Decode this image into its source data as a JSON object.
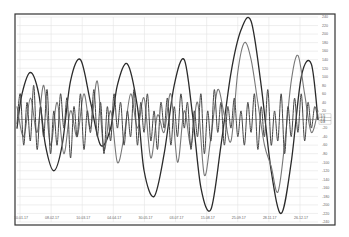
{
  "chart_data": {
    "type": "line",
    "title": "",
    "xlabel": "",
    "ylabel": "",
    "grid": true,
    "legend": "none",
    "x_tick_labels": [
      "10.01.17",
      "08.02.17",
      "10.03.17",
      "04.04.17",
      "30.05.17",
      "03.07.17",
      "15.08.17",
      "15.08.17",
      "25.09.17",
      "28.11.17",
      "26.12.17"
    ],
    "x_ticks_display": [
      "10.01.17",
      "08.02.17",
      "10.03.17",
      "04.04.17",
      "30.05.17",
      "03.07.17",
      "15.08.17",
      "25.09.17",
      "28.11.17",
      "26.12.17"
    ],
    "y_tick_labels": [
      "240",
      "220",
      "200",
      "180",
      "160",
      "140",
      "120",
      "100",
      "80",
      "60",
      "40",
      "20",
      "0",
      "-20",
      "-40",
      "-60",
      "-80",
      "-100",
      "-120",
      "-140",
      "-160",
      "-180",
      "-200",
      "-220",
      "-240"
    ],
    "ylim": [
      -240,
      240
    ],
    "series": [
      {
        "name": "Slow oscillator",
        "color": "#2b2b2b",
        "width": 1.3,
        "points": [
          [
            0,
            -20
          ],
          [
            3,
            60
          ],
          [
            8,
            110
          ],
          [
            13,
            60
          ],
          [
            17,
            -60
          ],
          [
            22,
            -120
          ],
          [
            27,
            -60
          ],
          [
            32,
            90
          ],
          [
            38,
            140
          ],
          [
            44,
            40
          ],
          [
            50,
            -60
          ],
          [
            56,
            -20
          ],
          [
            60,
            80
          ],
          [
            66,
            130
          ],
          [
            72,
            30
          ],
          [
            76,
            -120
          ],
          [
            82,
            -180
          ],
          [
            88,
            -80
          ],
          [
            94,
            80
          ],
          [
            100,
            140
          ],
          [
            105,
            10
          ],
          [
            110,
            -160
          ],
          [
            116,
            -210
          ],
          [
            122,
            -60
          ],
          [
            128,
            110
          ],
          [
            134,
            210
          ],
          [
            140,
            230
          ],
          [
            146,
            80
          ],
          [
            152,
            -120
          ],
          [
            158,
            -220
          ],
          [
            164,
            -100
          ],
          [
            170,
            100
          ],
          [
            176,
            130
          ],
          [
            180,
            0
          ]
        ]
      },
      {
        "name": "Medium oscillator",
        "color": "#777777",
        "width": 1.1,
        "points": [
          [
            0,
            30
          ],
          [
            4,
            -40
          ],
          [
            8,
            50
          ],
          [
            12,
            -30
          ],
          [
            16,
            80
          ],
          [
            20,
            -60
          ],
          [
            24,
            40
          ],
          [
            28,
            -80
          ],
          [
            32,
            20
          ],
          [
            36,
            -40
          ],
          [
            40,
            60
          ],
          [
            44,
            -20
          ],
          [
            48,
            90
          ],
          [
            52,
            -70
          ],
          [
            56,
            20
          ],
          [
            60,
            -100
          ],
          [
            64,
            -40
          ],
          [
            68,
            60
          ],
          [
            72,
            -20
          ],
          [
            76,
            50
          ],
          [
            80,
            -90
          ],
          [
            84,
            10
          ],
          [
            88,
            -30
          ],
          [
            92,
            60
          ],
          [
            96,
            -100
          ],
          [
            100,
            20
          ],
          [
            104,
            -60
          ],
          [
            108,
            40
          ],
          [
            112,
            -130
          ],
          [
            116,
            -40
          ],
          [
            120,
            70
          ],
          [
            124,
            10
          ],
          [
            128,
            -50
          ],
          [
            132,
            110
          ],
          [
            136,
            180
          ],
          [
            140,
            140
          ],
          [
            144,
            40
          ],
          [
            148,
            -60
          ],
          [
            152,
            -110
          ],
          [
            156,
            -170
          ],
          [
            160,
            -60
          ],
          [
            164,
            90
          ],
          [
            168,
            150
          ],
          [
            172,
            60
          ],
          [
            176,
            -30
          ],
          [
            180,
            20
          ]
        ]
      },
      {
        "name": "Fast oscillator",
        "color": "#444444",
        "width": 1.0,
        "points": [
          [
            0,
            -10
          ],
          [
            2,
            60
          ],
          [
            4,
            -60
          ],
          [
            6,
            40
          ],
          [
            8,
            -50
          ],
          [
            10,
            80
          ],
          [
            12,
            -70
          ],
          [
            14,
            30
          ],
          [
            16,
            -40
          ],
          [
            18,
            70
          ],
          [
            20,
            -80
          ],
          [
            22,
            20
          ],
          [
            24,
            -60
          ],
          [
            26,
            60
          ],
          [
            28,
            -20
          ],
          [
            30,
            50
          ],
          [
            32,
            -90
          ],
          [
            34,
            30
          ],
          [
            36,
            -40
          ],
          [
            38,
            60
          ],
          [
            40,
            -70
          ],
          [
            42,
            20
          ],
          [
            44,
            -30
          ],
          [
            46,
            70
          ],
          [
            48,
            -40
          ],
          [
            50,
            40
          ],
          [
            52,
            -80
          ],
          [
            54,
            30
          ],
          [
            56,
            -50
          ],
          [
            58,
            60
          ],
          [
            60,
            -20
          ],
          [
            62,
            40
          ],
          [
            64,
            -60
          ],
          [
            66,
            20
          ],
          [
            68,
            -40
          ],
          [
            70,
            70
          ],
          [
            72,
            -60
          ],
          [
            74,
            40
          ],
          [
            76,
            -30
          ],
          [
            78,
            60
          ],
          [
            80,
            -50
          ],
          [
            82,
            20
          ],
          [
            84,
            -70
          ],
          [
            86,
            40
          ],
          [
            88,
            -20
          ],
          [
            90,
            50
          ],
          [
            92,
            -60
          ],
          [
            94,
            30
          ],
          [
            96,
            -40
          ],
          [
            98,
            60
          ],
          [
            100,
            -20
          ],
          [
            102,
            40
          ],
          [
            104,
            -70
          ],
          [
            106,
            20
          ],
          [
            108,
            -40
          ],
          [
            110,
            60
          ],
          [
            112,
            -80
          ],
          [
            114,
            20
          ],
          [
            116,
            -50
          ],
          [
            118,
            70
          ],
          [
            120,
            -30
          ],
          [
            122,
            40
          ],
          [
            124,
            -60
          ],
          [
            126,
            30
          ],
          [
            128,
            -20
          ],
          [
            130,
            50
          ],
          [
            132,
            -40
          ],
          [
            134,
            20
          ],
          [
            136,
            -60
          ],
          [
            138,
            40
          ],
          [
            140,
            -30
          ],
          [
            142,
            60
          ],
          [
            144,
            -70
          ],
          [
            146,
            30
          ],
          [
            148,
            -40
          ],
          [
            150,
            70
          ],
          [
            152,
            -60
          ],
          [
            154,
            20
          ],
          [
            156,
            -50
          ],
          [
            158,
            60
          ],
          [
            160,
            -80
          ],
          [
            162,
            30
          ],
          [
            164,
            -40
          ],
          [
            166,
            50
          ],
          [
            168,
            -30
          ],
          [
            170,
            60
          ],
          [
            172,
            -50
          ],
          [
            174,
            40
          ],
          [
            176,
            -20
          ],
          [
            178,
            30
          ],
          [
            180,
            0
          ]
        ]
      }
    ],
    "x_range": [
      0,
      180
    ],
    "value_tags": [
      "5.5",
      "2.4",
      "0.8"
    ]
  },
  "layout": {
    "colors": {
      "frame": "#333333",
      "grid": "#e4e4e4",
      "zero_line": "#9a9a9a",
      "labels": "#666666"
    }
  }
}
